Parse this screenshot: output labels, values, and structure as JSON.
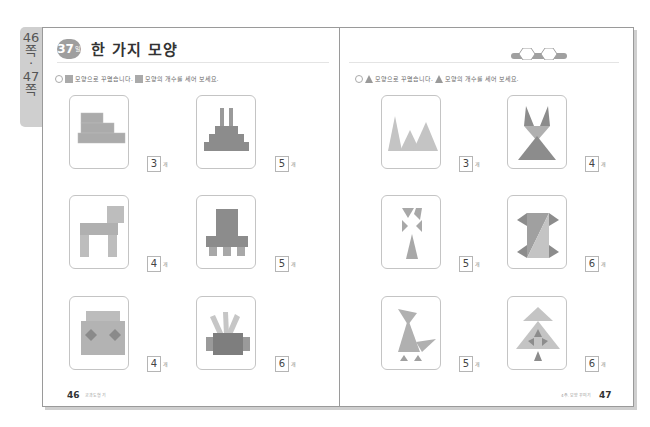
{
  "side_tab": {
    "lines": [
      "46",
      "쪽",
      "·",
      "47",
      "쪽"
    ]
  },
  "header": {
    "lesson_number": "37",
    "lesson_suffix": "일",
    "title": "한 가지 모양"
  },
  "left_page": {
    "instruction": {
      "number_icon": "circle-number-icon",
      "shape_icon": "square-icon",
      "text_before": "모양으로 꾸몄습니다.",
      "text_after": "모양의 개수를 세어 보세요."
    },
    "items": [
      {
        "figure": "stairs",
        "answer": "3",
        "unit": "개"
      },
      {
        "figure": "tower",
        "answer": "5",
        "unit": "개"
      },
      {
        "figure": "dog",
        "answer": "4",
        "unit": "개"
      },
      {
        "figure": "robot-base",
        "answer": "5",
        "unit": "개"
      },
      {
        "figure": "face",
        "answer": "4",
        "unit": "개"
      },
      {
        "figure": "crown-box",
        "answer": "6",
        "unit": "개"
      }
    ],
    "footer": {
      "page_number": "46",
      "label": "교과도형 기"
    }
  },
  "right_page": {
    "instruction": {
      "number_icon": "circle-number-icon",
      "shape_icon": "triangle-icon",
      "text_before": "모양으로 꾸몄습니다.",
      "text_after": "모양의 개수를 세어 보세요."
    },
    "items": [
      {
        "figure": "mountains",
        "answer": "3",
        "unit": "개"
      },
      {
        "figure": "fox",
        "answer": "4",
        "unit": "개"
      },
      {
        "figure": "flower",
        "answer": "5",
        "unit": "개"
      },
      {
        "figure": "spool",
        "answer": "6",
        "unit": "개"
      },
      {
        "figure": "bird",
        "answer": "5",
        "unit": "개"
      },
      {
        "figure": "tree",
        "answer": "6",
        "unit": "개"
      }
    ],
    "footer": {
      "page_number": "47",
      "label": "4주. 모양 꾸미기"
    }
  },
  "colors": {
    "shape_dark": "#8c8c8c",
    "shape_mid": "#a8a8a8",
    "shape_light": "#c4c4c4",
    "border": "#9a9a9a"
  }
}
